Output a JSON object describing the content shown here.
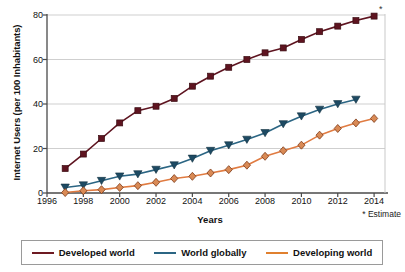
{
  "chart_data": {
    "type": "line",
    "title": "",
    "xlabel": "Years",
    "ylabel": "Internet Users (per 100 Inhabitants)",
    "xlim": [
      1996,
      2014.6
    ],
    "ylim": [
      0,
      80
    ],
    "xticks": [
      1996,
      1998,
      2000,
      2002,
      2004,
      2006,
      2008,
      2010,
      2012,
      2014
    ],
    "yticks": [
      0,
      20,
      40,
      60,
      80
    ],
    "grid": "horizontal",
    "legend_position": "bottom",
    "annotations": [
      "* Estimate",
      "*"
    ],
    "x": [
      1997,
      1998,
      1999,
      2000,
      2001,
      2002,
      2003,
      2004,
      2005,
      2006,
      2007,
      2008,
      2009,
      2010,
      2011,
      2012,
      2013,
      2014
    ],
    "series": [
      {
        "name": "Developed world",
        "color": "#5e1420",
        "marker": "square",
        "values": [
          11,
          17.5,
          24.5,
          31.5,
          37,
          39,
          42.5,
          48,
          52.5,
          56.5,
          60,
          63,
          65.2,
          69,
          72.5,
          75,
          77.5,
          79.5
        ]
      },
      {
        "name": "World globally",
        "color": "#2b6583",
        "marker": "triangle-down",
        "values": [
          2.5,
          3.5,
          5.5,
          7.5,
          8.5,
          10.5,
          12.5,
          15.5,
          19,
          21.5,
          24,
          27,
          31,
          34.5,
          37.5,
          40,
          42,
          null
        ]
      },
      {
        "name": "Developing world",
        "color": "#e07b41",
        "marker": "diamond",
        "values": [
          0.2,
          1,
          1.5,
          2.5,
          3.3,
          4.8,
          6.5,
          7.5,
          9,
          10.5,
          12.5,
          16.5,
          19,
          21.5,
          26,
          29,
          31.5,
          33.5
        ]
      }
    ]
  },
  "axes": {
    "ylabel": "Internet Users (per 100 Inhabitants)",
    "xlabel": "Years",
    "ytick_labels": [
      "0",
      "20",
      "40",
      "60",
      "80"
    ],
    "xtick_labels": [
      "1996",
      "1998",
      "2000",
      "2002",
      "2004",
      "2006",
      "2008",
      "2010",
      "2012",
      "2014"
    ]
  },
  "notes": {
    "estimate": "* Estimate",
    "estimate_marker": "*"
  },
  "legend": {
    "items": [
      {
        "label": "Developed world",
        "color": "#6e1a22"
      },
      {
        "label": "World globally",
        "color": "#2b6583"
      },
      {
        "label": "Developing world",
        "color": "#e0802f"
      }
    ]
  }
}
